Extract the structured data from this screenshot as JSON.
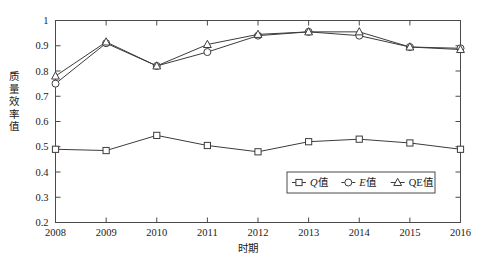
{
  "chart_data": {
    "type": "line",
    "title": "",
    "xlabel": "时期",
    "ylabel": "质量效率值",
    "categories": [
      "2008",
      "2009",
      "2010",
      "2011",
      "2012",
      "2013",
      "2014",
      "2015",
      "2016"
    ],
    "x": [
      2008,
      2009,
      2010,
      2011,
      2012,
      2013,
      2014,
      2015,
      2016
    ],
    "xlim": [
      2008,
      2016
    ],
    "ylim": [
      0.2,
      1
    ],
    "yticks": [
      "0.2",
      "0.3",
      "0.4",
      "0.5",
      "0.6",
      "0.7",
      "0.8",
      "0.9",
      "1"
    ],
    "ytick_values": [
      0.2,
      0.3,
      0.4,
      0.5,
      0.6,
      0.7,
      0.8,
      0.9,
      1.0
    ],
    "grid": false,
    "legend_position": "bottom-right",
    "series": [
      {
        "name": "Q值",
        "name_italic": "Q",
        "name_rest": "值",
        "marker": "square",
        "values": [
          0.49,
          0.485,
          0.545,
          0.505,
          0.48,
          0.52,
          0.53,
          0.515,
          0.49
        ]
      },
      {
        "name": "E值",
        "name_italic": "E",
        "name_rest": "值",
        "marker": "circle",
        "values": [
          0.75,
          0.91,
          0.82,
          0.875,
          0.94,
          0.955,
          0.94,
          0.895,
          0.89
        ]
      },
      {
        "name": "QE值",
        "name_italic": "",
        "name_rest": "QE值",
        "marker": "triangle",
        "values": [
          0.78,
          0.915,
          0.82,
          0.905,
          0.945,
          0.955,
          0.955,
          0.895,
          0.885
        ]
      }
    ],
    "colors": {
      "line": "#3c3c3c",
      "axis": "#4a4a4a",
      "marker_fill": "#ffffff",
      "background": "#ffffff"
    }
  }
}
